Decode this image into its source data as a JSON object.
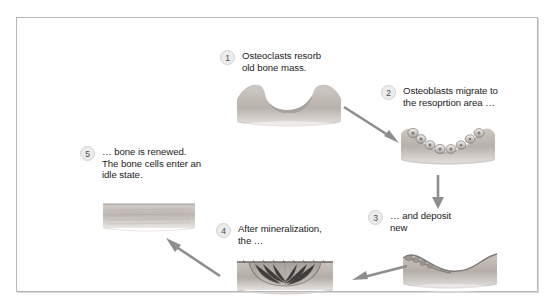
{
  "diagram": {
    "frame_color": "#b6b6b6",
    "background": "#ffffff",
    "arrow_color": "#8c8c8c",
    "bone_color": "#b9b2ad",
    "steps": [
      {
        "number": "1",
        "caption": "Osteoclasts resorb\nold bone mass."
      },
      {
        "number": "2",
        "caption": "Osteoblasts migrate to\nthe resoprtion area …"
      },
      {
        "number": "3",
        "caption": "… and deposit\nnew"
      },
      {
        "number": "4",
        "caption": "After mineralization,\nthe …"
      },
      {
        "number": "5",
        "caption": "… bone is renewed.\nThe bone cells enter an\nidle state."
      }
    ],
    "illustrations": [
      {
        "name": "bone-resorbed-pit",
        "step": "1"
      },
      {
        "name": "bone-with-osteoblasts",
        "step": "2"
      },
      {
        "name": "bone-new-osteoid-deposit",
        "step": "3"
      },
      {
        "name": "bone-mineralizing-seam",
        "step": "4"
      },
      {
        "name": "bone-renewed-smooth",
        "step": "5"
      }
    ],
    "arrows": [
      {
        "name": "arrow-step1-to-step2",
        "direction": "down-right"
      },
      {
        "name": "arrow-step2-to-step3",
        "direction": "down"
      },
      {
        "name": "arrow-step3-to-step4",
        "direction": "left"
      },
      {
        "name": "arrow-step4-to-step5",
        "direction": "up-left"
      }
    ]
  }
}
